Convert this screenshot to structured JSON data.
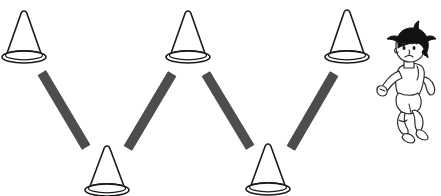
{
  "scene": {
    "title": "Zigzag slalom cone drill",
    "width": 441,
    "height": 196,
    "background_color": "#ffffff"
  },
  "palette": {
    "cone_stroke": "#1a1a1a",
    "cone_fill": "#ffffff",
    "bar_fill": "#4d4d4d",
    "bar_stroke": "#3b3b3b",
    "boy_outline": "#2b2b2b",
    "boy_hair": "#121212",
    "boy_fill": "#ffffff"
  },
  "cones": [
    {
      "id": "cone-top-left",
      "label": "Cone 1",
      "row": "top",
      "apex_x": 24,
      "apex_y": 11,
      "base_center_x": 24,
      "base_center_y": 57,
      "base_rx": 22,
      "base_ry": 6,
      "half_width": 18
    },
    {
      "id": "cone-bottom-left",
      "label": "Cone 2",
      "row": "bottom",
      "apex_x": 107,
      "apex_y": 146,
      "base_center_x": 107,
      "base_center_y": 190,
      "base_rx": 22,
      "base_ry": 6,
      "half_width": 18
    },
    {
      "id": "cone-top-middle",
      "label": "Cone 3",
      "row": "top",
      "apex_x": 188,
      "apex_y": 11,
      "base_center_x": 188,
      "base_center_y": 57,
      "base_rx": 22,
      "base_ry": 6,
      "half_width": 18
    },
    {
      "id": "cone-bottom-right",
      "label": "Cone 4",
      "row": "bottom",
      "apex_x": 268,
      "apex_y": 144,
      "base_center_x": 268,
      "base_center_y": 189,
      "base_rx": 22,
      "base_ry": 6,
      "half_width": 18
    },
    {
      "id": "cone-top-right",
      "label": "Cone 5",
      "row": "top",
      "apex_x": 347,
      "apex_y": 10,
      "base_center_x": 347,
      "base_center_y": 57,
      "base_rx": 22,
      "base_ry": 6,
      "half_width": 18
    }
  ],
  "bars": [
    {
      "id": "bar-1",
      "label": "Bar 1",
      "direction": "down-right",
      "x1": 42,
      "y1": 73,
      "x2": 86,
      "y2": 147,
      "thickness": 9
    },
    {
      "id": "bar-2",
      "label": "Bar 2",
      "direction": "up-right",
      "x1": 128,
      "y1": 148,
      "x2": 172,
      "y2": 74,
      "thickness": 9
    },
    {
      "id": "bar-3",
      "label": "Bar 3",
      "direction": "down-right",
      "x1": 206,
      "y1": 74,
      "x2": 250,
      "y2": 147,
      "thickness": 9
    },
    {
      "id": "bar-4",
      "label": "Bar 4",
      "direction": "up-right",
      "x1": 291,
      "y1": 148,
      "x2": 334,
      "y2": 74,
      "thickness": 9
    }
  ],
  "runner": {
    "id": "running-boy",
    "label": "Running boy",
    "description": "Cartoon boy with black spiky hair running to the left wearing a white t-shirt, shorts and sneakers",
    "x": 376,
    "y": 33,
    "width": 62,
    "height": 106,
    "hair_color": "#121212",
    "shirt_color": "#ffffff"
  }
}
